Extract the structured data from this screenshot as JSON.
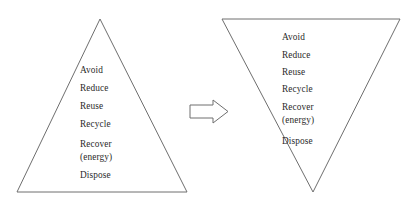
{
  "figure": {
    "background_color": "#ffffff",
    "outline_color": "#6e6e6e",
    "text_color": "#2b2b2b",
    "left_shape": {
      "name": "waste-hierarchy-pyramid-upright",
      "type": "triangle-up",
      "apex": [
        100,
        19
      ],
      "base_left": [
        17,
        192
      ],
      "base_right": [
        187,
        192
      ],
      "labels": [
        {
          "text": "Avoid",
          "y": 71
        },
        {
          "text": "Reduce",
          "y": 89
        },
        {
          "text": "Reuse",
          "y": 107
        },
        {
          "text": "Recycle",
          "y": 125
        },
        {
          "text": "Recover",
          "y": 145
        },
        {
          "text": "(energy)",
          "y": 158
        },
        {
          "text": "Dispose",
          "y": 176
        }
      ]
    },
    "arrow": {
      "name": "transformation-arrow",
      "direction": "right",
      "x": 190,
      "y": 100,
      "width": 38,
      "height": 23
    },
    "right_shape": {
      "name": "waste-hierarchy-pyramid-inverted",
      "type": "triangle-down",
      "top_left": [
        222,
        19
      ],
      "top_right": [
        400,
        19
      ],
      "apex": [
        313,
        192
      ],
      "labels": [
        {
          "text": "Avoid",
          "y": 38
        },
        {
          "text": "Reduce",
          "y": 56
        },
        {
          "text": "Reuse",
          "y": 73
        },
        {
          "text": "Recycle",
          "y": 90
        },
        {
          "text": "Recover",
          "y": 108
        },
        {
          "text": "(energy)",
          "y": 121
        },
        {
          "text": "Dispose",
          "y": 142
        }
      ]
    }
  }
}
